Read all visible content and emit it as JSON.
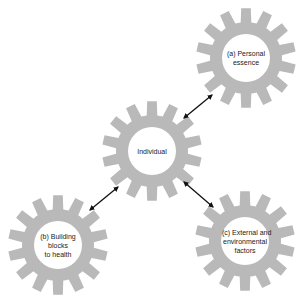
{
  "diagram": {
    "background": "#ffffff",
    "gear_style": {
      "fill": "#b9b9b9",
      "hole_fill": "#ffffff",
      "teeth": 14,
      "outer_radius": 50,
      "body_radius": 36,
      "hole_radius": 24,
      "tooth_base_half_width_deg": 8.5,
      "tooth_tip_half_width_deg": 5.5
    },
    "gears": [
      {
        "id": "individual",
        "cx": 152,
        "cy": 151,
        "label_lines": [
          "Individual"
        ]
      },
      {
        "id": "personal-essence",
        "cx": 246,
        "cy": 58,
        "label_lines": [
          "(a) Personal",
          "essence"
        ]
      },
      {
        "id": "building-blocks",
        "cx": 58,
        "cy": 245,
        "label_lines": [
          "(b) Building",
          "blocks",
          "to health"
        ]
      },
      {
        "id": "external-factors",
        "cx": 245,
        "cy": 241,
        "label_lines": [
          "(c) External and",
          "environmental",
          "factors"
        ]
      }
    ],
    "arrows": [
      {
        "id": "individual-to-personal-essence",
        "x1": 184,
        "y1": 118,
        "x2": 212,
        "y2": 95
      },
      {
        "id": "individual-to-building-blocks",
        "x1": 118,
        "y1": 187,
        "x2": 90,
        "y2": 210
      },
      {
        "id": "individual-to-external-factors",
        "x1": 184,
        "y1": 182,
        "x2": 213,
        "y2": 207
      }
    ],
    "arrow_color": "#111111",
    "labels": {
      "individual": "Individual",
      "personal_essence_1": "(a) Personal",
      "personal_essence_2": "essence",
      "building_blocks_1": "(b) Building",
      "building_blocks_2": "blocks",
      "building_blocks_3": "to health",
      "external_1": "(c) External and",
      "external_2": "environmental",
      "external_3": "factors"
    }
  }
}
